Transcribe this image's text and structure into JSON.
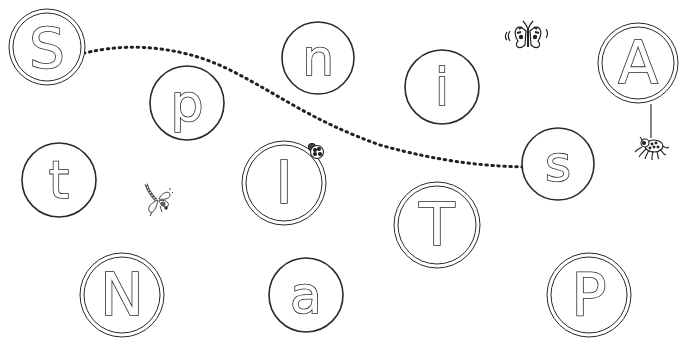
{
  "worksheet": {
    "task": "letter-path-tracing",
    "path": {
      "start_letter": "S",
      "end_letter": "s",
      "style": "dotted-arrow"
    },
    "letters": [
      {
        "char": "S",
        "cx": 47,
        "cy": 47,
        "r": 38,
        "ring": "double",
        "size": 56
      },
      {
        "char": "p",
        "cx": 187,
        "cy": 103,
        "r": 37,
        "ring": "single",
        "size": 52
      },
      {
        "char": "n",
        "cx": 318,
        "cy": 58,
        "r": 36,
        "ring": "single",
        "size": 50
      },
      {
        "char": "i",
        "cx": 442,
        "cy": 87,
        "r": 37,
        "ring": "single",
        "size": 52
      },
      {
        "char": "A",
        "cx": 638,
        "cy": 63,
        "r": 40,
        "ring": "double",
        "size": 58
      },
      {
        "char": "t",
        "cx": 59,
        "cy": 180,
        "r": 37,
        "ring": "single",
        "size": 52
      },
      {
        "char": "I",
        "cx": 284,
        "cy": 183,
        "r": 42,
        "ring": "double",
        "size": 58
      },
      {
        "char": "T",
        "cx": 437,
        "cy": 225,
        "r": 43,
        "ring": "double",
        "size": 58
      },
      {
        "char": "s",
        "cx": 558,
        "cy": 164,
        "r": 36,
        "ring": "single",
        "size": 50
      },
      {
        "char": "N",
        "cx": 122,
        "cy": 295,
        "r": 42,
        "ring": "double",
        "size": 58
      },
      {
        "char": "a",
        "cx": 306,
        "cy": 295,
        "r": 37,
        "ring": "single",
        "size": 52
      },
      {
        "char": "P",
        "cx": 589,
        "cy": 295,
        "r": 42,
        "ring": "double",
        "size": 58
      }
    ],
    "decorations": [
      {
        "name": "butterfly",
        "x": 528,
        "y": 35
      },
      {
        "name": "spider",
        "x": 652,
        "y": 145
      },
      {
        "name": "ladybird",
        "x": 315,
        "y": 150
      },
      {
        "name": "dragonfly",
        "x": 158,
        "y": 198
      }
    ],
    "colors": {
      "line": "#2a2a2a",
      "background": "#ffffff"
    }
  }
}
